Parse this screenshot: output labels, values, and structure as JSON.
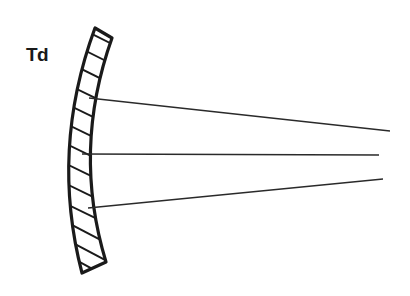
{
  "diagram": {
    "label": "Td",
    "colors": {
      "stroke": "#1a1a1a",
      "background": "#ffffff"
    },
    "mirror": {
      "type": "concave-mirror",
      "hatched": true
    },
    "rays": [
      {
        "name": "upper-ray",
        "from": [
          89,
          98
        ],
        "to": [
          390,
          131
        ]
      },
      {
        "name": "center-ray",
        "from": [
          82,
          154
        ],
        "to": [
          379,
          155
        ]
      },
      {
        "name": "lower-ray",
        "from": [
          88,
          208
        ],
        "to": [
          383,
          179
        ]
      }
    ],
    "focal_point": [
      292,
      155
    ]
  }
}
